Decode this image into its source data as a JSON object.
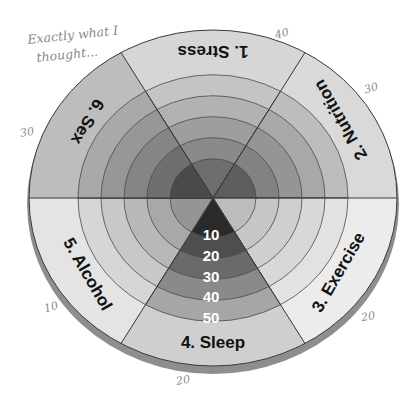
{
  "annotation": {
    "line1": "Exactly what I",
    "line2": "thought..."
  },
  "wheel": {
    "segments": [
      {
        "id": "stress",
        "label": "1. Stress"
      },
      {
        "id": "nutrition",
        "label": "2. Nutrition"
      },
      {
        "id": "exercise",
        "label": "3. Exercise"
      },
      {
        "id": "sleep",
        "label": "4. Sleep"
      },
      {
        "id": "alcohol",
        "label": "5. Alcohol"
      },
      {
        "id": "sex",
        "label": "6. Sex"
      }
    ],
    "scale": [
      "10",
      "20",
      "30",
      "40",
      "50"
    ],
    "handwritten_scores": {
      "stress": "40",
      "nutrition": "30",
      "exercise": "20",
      "sleep": "20",
      "alcohol": "10",
      "sex": "30"
    }
  },
  "colors": {
    "outline": "#3a3a3a",
    "rim": "#8e8e8e"
  }
}
